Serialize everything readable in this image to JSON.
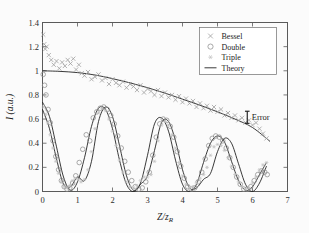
{
  "figure": {
    "background": "#fbfbfb",
    "foreground": "#1c1c1c"
  },
  "annotations": {
    "error_label": "Error",
    "error_marker": "errorbar-i-beam"
  },
  "legend": {
    "position": "top-right",
    "entries": [
      {
        "label": "Bessel",
        "marker": "cross-x",
        "color": "#9a9a9a"
      },
      {
        "label": "Double",
        "marker": "circle-open",
        "color": "#8d8d8d"
      },
      {
        "label": "Triple",
        "marker": "asterisk",
        "color": "#c2c2c2"
      },
      {
        "label": "Theory",
        "marker": "line",
        "color": "#161616"
      }
    ]
  },
  "chart_data": {
    "type": "scatter",
    "title": "",
    "xlabel": "Z/zr",
    "ylabel": "I (a.u.)",
    "xlim": [
      0,
      7
    ],
    "ylim": [
      0,
      1.4
    ],
    "xticks": [
      0,
      1,
      2,
      3,
      4,
      5,
      6,
      7
    ],
    "yticks": [
      0,
      0.2,
      0.4,
      0.6,
      0.8,
      1,
      1.2,
      1.4
    ],
    "xticklabels": [
      "0",
      "1",
      "2",
      "3",
      "4",
      "5",
      "6",
      "7"
    ],
    "yticklabels": [
      "0",
      "0.2",
      "0.4",
      "0.6",
      "0.8",
      "1",
      "1.2",
      "1.4"
    ],
    "grid": false,
    "legend_position": "upper right",
    "series": [
      {
        "name": "Bessel",
        "marker": "cross-x",
        "color": "#9a9a9a",
        "x": [
          0.02,
          0.05,
          0.08,
          0.12,
          0.18,
          0.25,
          0.32,
          0.4,
          0.48,
          0.56,
          0.64,
          0.72,
          0.8,
          0.88,
          0.96,
          1.04,
          1.12,
          1.2,
          1.3,
          1.4,
          1.5,
          1.6,
          1.7,
          1.8,
          1.9,
          2.0,
          2.1,
          2.2,
          2.3,
          2.4,
          2.5,
          2.6,
          2.7,
          2.8,
          2.9,
          3.0,
          3.1,
          3.2,
          3.3,
          3.4,
          3.5,
          3.6,
          3.7,
          3.8,
          3.9,
          4.0,
          4.1,
          4.2,
          4.3,
          4.4,
          4.5,
          4.6,
          4.7,
          4.8,
          4.9,
          5.0,
          5.1,
          5.2,
          5.3,
          5.4,
          5.5,
          5.6,
          5.7,
          5.8,
          5.9,
          6.0,
          6.1,
          6.2,
          6.3,
          6.4
        ],
        "y": [
          1.3,
          1.22,
          1.18,
          1.2,
          1.13,
          1.09,
          1.05,
          1.08,
          1.02,
          1.07,
          1.04,
          1.09,
          1.06,
          1.1,
          1.01,
          1.05,
          0.98,
          0.96,
          0.99,
          0.93,
          0.95,
          0.97,
          0.92,
          0.94,
          0.89,
          0.93,
          0.9,
          0.88,
          0.91,
          0.86,
          0.89,
          0.87,
          0.84,
          0.88,
          0.82,
          0.85,
          0.83,
          0.8,
          0.84,
          0.79,
          0.82,
          0.78,
          0.8,
          0.76,
          0.79,
          0.74,
          0.77,
          0.73,
          0.75,
          0.7,
          0.73,
          0.69,
          0.71,
          0.67,
          0.7,
          0.66,
          0.68,
          0.63,
          0.65,
          0.61,
          0.63,
          0.59,
          0.61,
          0.57,
          0.59,
          0.55,
          0.57,
          0.52,
          0.48,
          0.44
        ]
      },
      {
        "name": "Double",
        "marker": "circle-open",
        "color": "#8d8d8d",
        "x": [
          0.02,
          0.06,
          0.1,
          0.16,
          0.22,
          0.3,
          0.38,
          0.46,
          0.54,
          0.62,
          0.7,
          0.78,
          0.86,
          0.95,
          1.05,
          1.15,
          1.25,
          1.35,
          1.45,
          1.55,
          1.65,
          1.75,
          1.85,
          1.95,
          2.05,
          2.15,
          2.25,
          2.35,
          2.45,
          2.55,
          2.65,
          2.75,
          2.85,
          2.95,
          3.05,
          3.15,
          3.25,
          3.35,
          3.45,
          3.55,
          3.65,
          3.75,
          3.85,
          3.95,
          4.05,
          4.15,
          4.25,
          4.35,
          4.45,
          4.55,
          4.65,
          4.75,
          4.85,
          4.95,
          5.05,
          5.15,
          5.25,
          5.35,
          5.45,
          5.55,
          5.65,
          5.75,
          5.85,
          5.95,
          6.05,
          6.15,
          6.25,
          6.35,
          6.42
        ],
        "y": [
          0.97,
          0.88,
          0.8,
          0.68,
          0.57,
          0.42,
          0.29,
          0.18,
          0.09,
          0.04,
          0.02,
          0.03,
          0.07,
          0.13,
          0.24,
          0.35,
          0.47,
          0.42,
          0.61,
          0.66,
          0.69,
          0.7,
          0.68,
          0.63,
          0.56,
          0.46,
          0.36,
          0.25,
          0.16,
          0.09,
          0.04,
          0.02,
          0.03,
          0.08,
          0.16,
          0.3,
          0.45,
          0.56,
          0.6,
          0.59,
          0.54,
          0.45,
          0.33,
          0.21,
          0.11,
          0.04,
          0.02,
          0.03,
          0.08,
          0.16,
          0.27,
          0.38,
          0.44,
          0.46,
          0.45,
          0.42,
          0.36,
          0.28,
          0.2,
          0.12,
          0.06,
          0.02,
          0.02,
          0.04,
          0.09,
          0.14,
          0.17,
          0.16,
          0.14
        ]
      },
      {
        "name": "Triple",
        "marker": "asterisk",
        "color": "#c2c2c2",
        "x": [
          0.03,
          0.09,
          0.15,
          0.22,
          0.3,
          0.38,
          0.46,
          0.54,
          0.62,
          0.7,
          0.78,
          0.86,
          0.94,
          1.02,
          1.1,
          1.2,
          1.3,
          1.4,
          1.5,
          1.6,
          1.7,
          1.8,
          1.9,
          2.0,
          2.1,
          2.2,
          2.3,
          2.4,
          2.5,
          2.6,
          2.7,
          2.8,
          2.9,
          3.0,
          3.1,
          3.2,
          3.3,
          3.4,
          3.5,
          3.6,
          3.7,
          3.8,
          3.9,
          4.0,
          4.1,
          4.2,
          4.3,
          4.4,
          4.5,
          4.6,
          4.7,
          4.8,
          4.9,
          5.0,
          5.1,
          5.2,
          5.3,
          5.4,
          5.5,
          5.6,
          5.7,
          5.8,
          5.9,
          6.0,
          6.1,
          6.2,
          6.3,
          6.4
        ],
        "y": [
          0.7,
          0.64,
          0.57,
          0.47,
          0.36,
          0.25,
          0.15,
          0.08,
          0.04,
          0.03,
          0.05,
          0.09,
          0.11,
          0.1,
          0.08,
          0.1,
          0.18,
          0.33,
          0.52,
          0.65,
          0.69,
          0.67,
          0.6,
          0.5,
          0.38,
          0.26,
          0.16,
          0.08,
          0.04,
          0.03,
          0.05,
          0.09,
          0.12,
          0.12,
          0.14,
          0.25,
          0.42,
          0.55,
          0.58,
          0.55,
          0.47,
          0.36,
          0.24,
          0.13,
          0.06,
          0.03,
          0.04,
          0.07,
          0.11,
          0.14,
          0.2,
          0.3,
          0.37,
          0.39,
          0.38,
          0.34,
          0.28,
          0.21,
          0.14,
          0.08,
          0.04,
          0.02,
          0.03,
          0.07,
          0.12,
          0.18,
          0.22,
          0.24
        ]
      },
      {
        "name": "Theory-envelope",
        "marker": "line",
        "color": "#161616",
        "comment": "slowly decaying Bessel envelope from 1.0 to 0.41",
        "x": [
          0.0,
          0.5,
          1.0,
          1.5,
          2.0,
          2.5,
          3.0,
          3.5,
          4.0,
          4.5,
          5.0,
          5.5,
          6.0,
          6.5
        ],
        "y": [
          1.0,
          0.995,
          0.985,
          0.965,
          0.935,
          0.9,
          0.86,
          0.815,
          0.765,
          0.715,
          0.66,
          0.6,
          0.53,
          0.415
        ]
      },
      {
        "name": "Theory-double",
        "marker": "line",
        "color": "#161616",
        "comment": "oscillating theory curve matching Double markers, period ~1.63",
        "x": [
          0.0,
          0.2,
          0.4,
          0.6,
          0.8,
          1.0,
          1.2,
          1.4,
          1.6,
          1.8,
          2.0,
          2.2,
          2.4,
          2.6,
          2.8,
          3.0,
          3.2,
          3.4,
          3.6,
          3.8,
          4.0,
          4.2,
          4.4,
          4.6,
          4.8,
          5.0,
          5.2,
          5.4,
          5.6,
          5.8,
          6.0,
          6.2,
          6.4
        ],
        "y": [
          0.74,
          0.62,
          0.37,
          0.12,
          0.01,
          0.08,
          0.28,
          0.54,
          0.69,
          0.68,
          0.52,
          0.26,
          0.06,
          0.0,
          0.07,
          0.3,
          0.56,
          0.61,
          0.5,
          0.26,
          0.06,
          0.0,
          0.06,
          0.24,
          0.4,
          0.46,
          0.41,
          0.25,
          0.09,
          0.01,
          0.04,
          0.14,
          0.24
        ]
      },
      {
        "name": "Theory-triple",
        "marker": "line",
        "color": "#161616",
        "comment": "second oscillating theory curve matching Triple markers, phase-shifted",
        "x": [
          0.0,
          0.2,
          0.4,
          0.6,
          0.8,
          1.0,
          1.2,
          1.4,
          1.6,
          1.8,
          2.0,
          2.2,
          2.4,
          2.6,
          2.8,
          3.0,
          3.2,
          3.4,
          3.6,
          3.8,
          4.0,
          4.2,
          4.4,
          4.6,
          4.8,
          5.0,
          5.2,
          5.4,
          5.6,
          5.8,
          6.0,
          6.2,
          6.4
        ],
        "y": [
          0.68,
          0.52,
          0.27,
          0.06,
          0.04,
          0.12,
          0.09,
          0.25,
          0.58,
          0.7,
          0.62,
          0.38,
          0.13,
          0.01,
          0.06,
          0.13,
          0.34,
          0.57,
          0.58,
          0.42,
          0.18,
          0.03,
          0.03,
          0.1,
          0.15,
          0.33,
          0.44,
          0.4,
          0.23,
          0.06,
          0.0,
          0.07,
          0.21
        ]
      }
    ],
    "error_bar": {
      "x": 5.85,
      "y": 0.615,
      "half_height": 0.05
    }
  }
}
